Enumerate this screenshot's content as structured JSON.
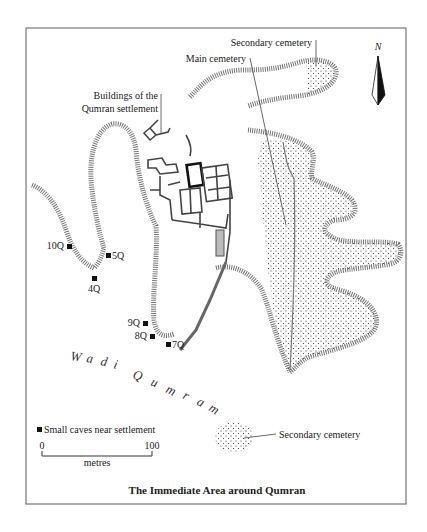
{
  "map": {
    "title": "The Immediate Area around Qumran",
    "north_label": "N",
    "labels": {
      "secondary_cemetery_top": "Secondary cemetery",
      "main_cemetery": "Main cemetery",
      "buildings_line1": "Buildings of the",
      "buildings_line2": "Qumran settlement",
      "secondary_cemetery_bottom": "Secondary cemetery"
    },
    "wadi_label": [
      "W",
      "a",
      "d",
      "i",
      "Q",
      "u",
      "m",
      "r",
      "a",
      "m"
    ],
    "caves": [
      {
        "id": "10Q",
        "label": "10Q"
      },
      {
        "id": "5Q",
        "label": "5Q"
      },
      {
        "id": "4Q",
        "label": "4Q"
      },
      {
        "id": "9Q",
        "label": "9Q"
      },
      {
        "id": "8Q",
        "label": "8Q"
      },
      {
        "id": "7Q",
        "label": "7Q"
      }
    ],
    "legend": {
      "caves_label": "Small caves near settlement",
      "scale_start": "0",
      "scale_end": "100",
      "scale_unit": "metres"
    },
    "colors": {
      "border": "#777777",
      "cliff": "#777777",
      "ink": "#222222",
      "paper": "#ffffff"
    }
  }
}
